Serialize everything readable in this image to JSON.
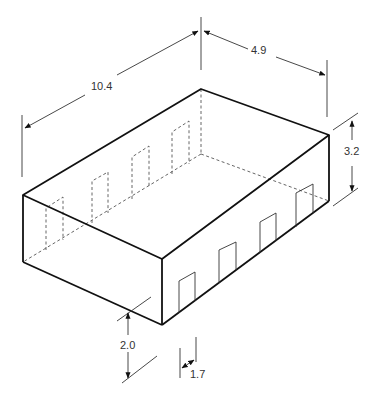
{
  "diagram": {
    "type": "isometric-box",
    "dimensions": {
      "length": "10.4",
      "width": "4.9",
      "height": "3.2",
      "door_height": "2.0",
      "door_width": "1.7"
    },
    "colors": {
      "line": "#111111",
      "hidden_line": "#555555",
      "dim_line": "#333333"
    }
  }
}
